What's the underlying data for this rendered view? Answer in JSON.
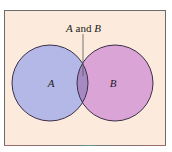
{
  "diagram": {
    "type": "venn",
    "title_label": {
      "a": "A",
      "conj": " and ",
      "b": "B"
    },
    "sets": [
      {
        "name": "A",
        "label": "A",
        "color": "#b4b8e6"
      },
      {
        "name": "B",
        "label": "B",
        "color": "#dba4d6"
      }
    ],
    "intersection": {
      "label": "A and B",
      "color": "#a58ac2"
    },
    "colors": {
      "background": "#fcebdc",
      "frame_border": "#6b6b6b",
      "circle_stroke": "#3a2f4a",
      "leader_line": "#555555",
      "text": "#1a1a1a"
    }
  }
}
